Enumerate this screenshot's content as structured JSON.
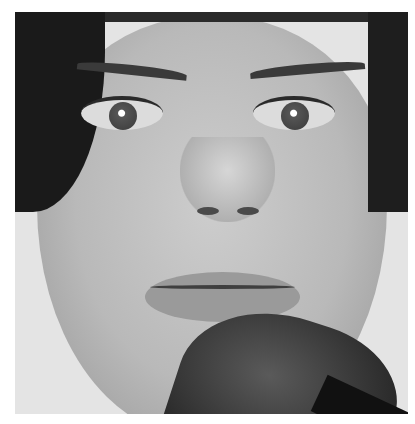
{
  "image": {
    "description": "Black and white close-up portrait of a woman's face with a makeup brush applied to her chin",
    "subject": "woman",
    "object": "makeup-brush",
    "palette": {
      "background": "#ffffff",
      "skin": "#bdbdbd",
      "hair": "#1a1a1a",
      "brush": "#2a2a2a"
    }
  }
}
